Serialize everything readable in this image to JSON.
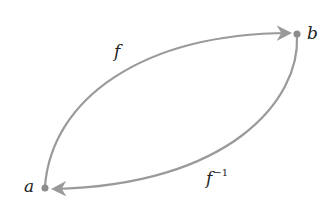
{
  "diagram": {
    "type": "function-inverse-mapping",
    "nodes": [
      {
        "id": "a",
        "label": "a",
        "x": 45,
        "y": 188
      },
      {
        "id": "b",
        "label": "b",
        "x": 297,
        "y": 34
      }
    ],
    "edges": [
      {
        "from": "a",
        "to": "b",
        "label": "f",
        "path": "upper"
      },
      {
        "from": "b",
        "to": "a",
        "label_base": "f",
        "label_sup": "−1",
        "path": "lower"
      }
    ],
    "colors": {
      "stroke": "#9a9a9a",
      "node": "#8c8c8c",
      "text": "#222222",
      "background": "#ffffff"
    }
  }
}
